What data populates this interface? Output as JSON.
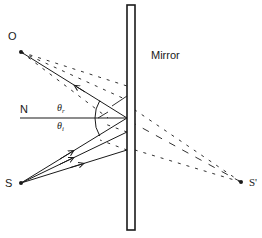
{
  "diagram": {
    "colors": {
      "ink": "#1a1a1a",
      "background": "#ffffff"
    },
    "labels": {
      "observer": "O",
      "normal": "N",
      "source": "S",
      "image": "S'",
      "mirror": "Mirror",
      "theta": "θ",
      "reflected_sub": "r",
      "incident_sub": "i"
    },
    "points": {
      "O": [
        21,
        52
      ],
      "S": [
        21,
        183
      ],
      "S_prime": [
        241,
        182
      ],
      "normal_foot": [
        127,
        118
      ]
    },
    "mirror_rect": {
      "x": 127,
      "y": 5,
      "width": 8,
      "height": 225
    },
    "incident_rays": [
      {
        "from": "S",
        "to": [
          127,
          118
        ],
        "arrow": true
      },
      {
        "from": "S",
        "to": [
          127,
          132
        ],
        "arrow": true
      },
      {
        "from": "S",
        "to": [
          127,
          150
        ],
        "arrow": true
      }
    ],
    "reflected_ray": {
      "from": [
        127,
        118
      ],
      "to": "O",
      "arrow": true
    },
    "virtual_rays_from_image": [
      "to mirror y=110",
      "to mirror y=118",
      "to mirror y=150"
    ],
    "angles": [
      "θr (angle of reflection)",
      "θi (angle of incidence)"
    ]
  }
}
